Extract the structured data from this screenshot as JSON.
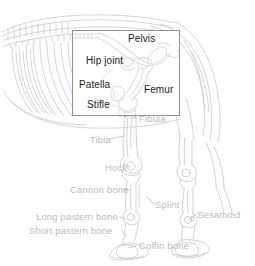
{
  "figure": {
    "style": "line-art",
    "colors": {
      "background": "#ffffff",
      "faint_line": "#c6c9cb",
      "mid_line": "#a9adb0",
      "dark_line": "#1b1b1b",
      "faint_text": "#b9bcbe",
      "strong_text": "#1b1b1b",
      "inset_border": "#8d9094"
    }
  },
  "inset": {
    "name": "magnified-hip-and-stifle-detail",
    "x": 72,
    "y": 30,
    "width": 108,
    "height": 86,
    "labels": [
      {
        "text": "Pelvis",
        "x": 128,
        "y": 34,
        "leader": false
      },
      {
        "text": "Hip joint",
        "x": 86,
        "y": 60,
        "leader": true
      },
      {
        "text": "Patella",
        "x": 79,
        "y": 81,
        "leader": true
      },
      {
        "text": "Femur",
        "x": 144,
        "y": 86,
        "leader": true
      },
      {
        "text": "Stifle",
        "x": 87,
        "y": 101,
        "leader": true
      }
    ]
  },
  "outer_labels": [
    {
      "text": "Fibula",
      "x": 139,
      "y": 114,
      "leader": true
    },
    {
      "text": "Tibia",
      "x": 90,
      "y": 135,
      "leader": true
    },
    {
      "text": "Hock",
      "x": 109,
      "y": 163,
      "leader": true
    },
    {
      "text": "Cannon bone",
      "x": 75,
      "y": 186,
      "leader": true
    },
    {
      "text": "Splint",
      "x": 155,
      "y": 200,
      "leader": false
    },
    {
      "text": "Sesamoid",
      "x": 197,
      "y": 211,
      "leader": false
    },
    {
      "text": "Long pastern bone",
      "x": 39,
      "y": 213,
      "leader": true
    },
    {
      "text": "Short pastern bone",
      "x": 32,
      "y": 227,
      "leader": true
    },
    {
      "text": "Coffin bone",
      "x": 137,
      "y": 242,
      "leader": true
    }
  ]
}
